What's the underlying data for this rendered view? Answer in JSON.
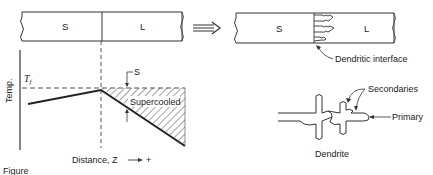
{
  "left_panel": {
    "bar": {
      "solid_label": "S",
      "liquid_label": "L"
    },
    "graph": {
      "y_axis_label": "Temp.",
      "tf_label": "T",
      "tf_subscript": "f",
      "supercooling_marker": "S",
      "region_label": "Supercooled",
      "x_axis_label": "Distance, Z",
      "x_axis_direction": "+"
    }
  },
  "arrow": {
    "direction": "right"
  },
  "right_panel": {
    "bar": {
      "solid_label": "S",
      "liquid_label": "L"
    },
    "interface_label": "Dendritic interface",
    "dendrite": {
      "secondaries_label": "Secondaries",
      "primary_label": "Primary",
      "caption": "Dendrite"
    }
  },
  "figure_caption_fragment": "Figure"
}
